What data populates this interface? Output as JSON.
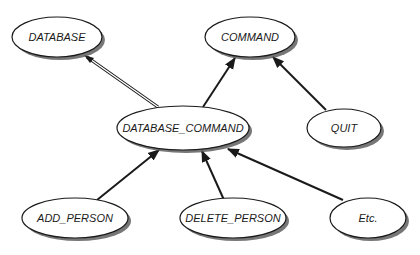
{
  "diagram": {
    "type": "class-inheritance",
    "nodes": [
      {
        "id": "database",
        "label": "DATABASE",
        "cx": 57,
        "cy": 37,
        "rx": 45,
        "ry": 20
      },
      {
        "id": "command",
        "label": "COMMAND",
        "cx": 250,
        "cy": 37,
        "rx": 45,
        "ry": 20
      },
      {
        "id": "database_command",
        "label": "DATABASE_COMMAND",
        "cx": 183,
        "cy": 128,
        "rx": 66,
        "ry": 22
      },
      {
        "id": "quit",
        "label": "QUIT",
        "cx": 344,
        "cy": 128,
        "rx": 37,
        "ry": 19
      },
      {
        "id": "add_person",
        "label": "ADD_PERSON",
        "cx": 75,
        "cy": 218,
        "rx": 53,
        "ry": 20
      },
      {
        "id": "delete_person",
        "label": "DELETE_PERSON",
        "cx": 233,
        "cy": 218,
        "rx": 53,
        "ry": 20
      },
      {
        "id": "etc",
        "label": "Etc.",
        "cx": 368,
        "cy": 218,
        "rx": 38,
        "ry": 20
      }
    ],
    "edges": [
      {
        "from": "database_command",
        "to": "database",
        "style": "double-line"
      },
      {
        "from": "database_command",
        "to": "command",
        "style": "single"
      },
      {
        "from": "quit",
        "to": "command",
        "style": "single"
      },
      {
        "from": "add_person",
        "to": "database_command",
        "style": "single"
      },
      {
        "from": "delete_person",
        "to": "database_command",
        "style": "single"
      },
      {
        "from": "etc",
        "to": "database_command",
        "style": "single"
      }
    ],
    "colors": {
      "node_fill": "#ffffff",
      "node_stroke": "#1a1a1a",
      "shadow": "#555555",
      "edge": "#1a1a1a"
    }
  }
}
